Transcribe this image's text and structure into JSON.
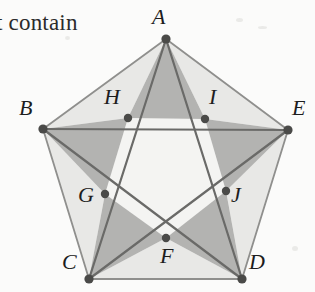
{
  "figure": {
    "caption_fragment": "t contain",
    "canvas": {
      "width": 315,
      "height": 292
    },
    "background_color": "#fbfbfa",
    "colors": {
      "outer_region_fill": "#e8e8e6",
      "star_arm_fill": "#b3b3b1",
      "inner_pentagon_fill": "#f4f4f2",
      "outer_edge_stroke": "#8f8f8d",
      "chord_stroke": "#6a6a68",
      "vertex_dot": "#4a4a48",
      "label_color": "#1d1d1d"
    },
    "outer_vertices": [
      {
        "id": "A",
        "label": "A",
        "x": 166,
        "y": 39,
        "label_x": 152,
        "label_y": 6
      },
      {
        "id": "B",
        "label": "B",
        "x": 43,
        "y": 129,
        "label_x": 19,
        "label_y": 97
      },
      {
        "id": "C",
        "label": "C",
        "x": 89,
        "y": 279,
        "label_x": 62,
        "label_y": 251
      },
      {
        "id": "D",
        "label": "D",
        "x": 242,
        "y": 279,
        "label_x": 249,
        "label_y": 251
      },
      {
        "id": "E",
        "label": "E",
        "x": 288,
        "y": 130,
        "label_x": 292,
        "label_y": 97
      }
    ],
    "inner_vertices": [
      {
        "id": "F",
        "label": "F",
        "x": 166,
        "y": 238,
        "label_x": 160,
        "label_y": 245
      },
      {
        "id": "G",
        "label": "G",
        "x": 105,
        "y": 194,
        "label_x": 78,
        "label_y": 184
      },
      {
        "id": "H",
        "label": "H",
        "x": 128,
        "y": 118,
        "label_x": 104,
        "label_y": 86
      },
      {
        "id": "I",
        "label": "I",
        "x": 205,
        "y": 119,
        "label_x": 209,
        "label_y": 86
      },
      {
        "id": "J",
        "label": "J",
        "x": 226,
        "y": 191,
        "label_x": 231,
        "label_y": 184
      }
    ],
    "outer_pentagon_path": "M166,39 L288,130 L242,279 L89,279 L43,129 Z",
    "inner_pentagon_path": "M128,118 L205,119 L226,191 L166,238 L105,194 Z",
    "star_arms": [
      {
        "id": "arm-A",
        "apex": "A",
        "path": "M166,39 L205,119 L128,118 Z"
      },
      {
        "id": "arm-E",
        "apex": "E",
        "path": "M288,130 L226,191 L205,119 Z"
      },
      {
        "id": "arm-D",
        "apex": "D",
        "path": "M242,279 L166,238 L226,191 Z"
      },
      {
        "id": "arm-C",
        "apex": "C",
        "path": "M89,279 L105,194 L166,238 Z"
      },
      {
        "id": "arm-B",
        "apex": "B",
        "path": "M43,129 L128,118 L105,194 Z"
      }
    ],
    "outer_regions": [
      {
        "id": "region-A-B-H",
        "path": "M166,39 L128,118 L43,129 Z"
      },
      {
        "id": "region-A-E-I",
        "path": "M166,39 L288,130 L205,119 Z"
      },
      {
        "id": "region-E-D-J",
        "path": "M288,130 L242,279 L226,191 Z"
      },
      {
        "id": "region-D-C-F",
        "path": "M242,279 L89,279 L166,238 Z"
      },
      {
        "id": "region-C-B-G",
        "path": "M89,279 L43,129 L105,194 Z"
      }
    ],
    "chords": [
      {
        "id": "chord-A-C",
        "x1": 166,
        "y1": 39,
        "x2": 89,
        "y2": 279
      },
      {
        "id": "chord-A-D",
        "x1": 166,
        "y1": 39,
        "x2": 242,
        "y2": 279
      },
      {
        "id": "chord-B-D",
        "x1": 43,
        "y1": 129,
        "x2": 242,
        "y2": 279
      },
      {
        "id": "chord-B-E",
        "x1": 43,
        "y1": 129,
        "x2": 288,
        "y2": 130
      },
      {
        "id": "chord-C-E",
        "x1": 89,
        "y1": 279,
        "x2": 288,
        "y2": 130
      }
    ]
  }
}
